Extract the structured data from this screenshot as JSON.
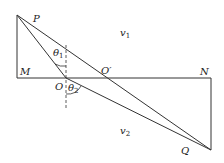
{
  "diagram": {
    "type": "refraction-geometry",
    "labels": {
      "P": "P",
      "M": "M",
      "O": "O",
      "O_prime": "O′",
      "N": "N",
      "Q": "Q",
      "theta1": "θ",
      "theta1_sub": "1",
      "theta2": "θ",
      "theta2_sub": "2",
      "v1": "v",
      "v1_sub": "1",
      "v2": "v",
      "v2_sub": "2"
    },
    "points": {
      "P": [
        17,
        15
      ],
      "M": [
        17,
        78
      ],
      "O": [
        66,
        78
      ],
      "O_prime": [
        103,
        78
      ],
      "N": [
        211,
        78
      ],
      "Q": [
        211,
        150
      ]
    },
    "colors": {
      "stroke": "#333333",
      "background": "#ffffff"
    }
  }
}
